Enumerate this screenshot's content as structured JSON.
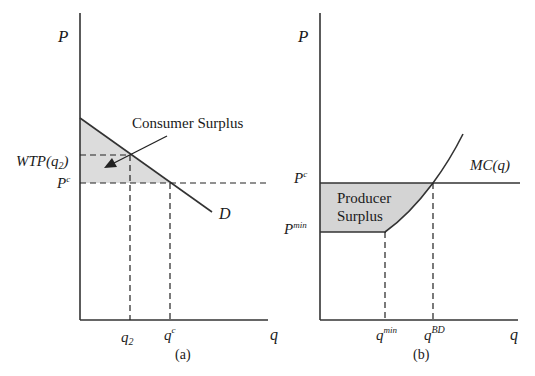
{
  "panel_a": {
    "y_axis_label": "P",
    "x_axis_label": "q",
    "caption": "(a)",
    "annotation": "Consumer Surplus",
    "curve_label": "D",
    "y_tick_wtp": "WTP(q",
    "y_tick_wtp_sub": "2",
    "y_tick_wtp_close": ")",
    "y_tick_pc": "P",
    "y_tick_pc_sup": "c",
    "x_tick_q2": "q",
    "x_tick_q2_sub": "2",
    "x_tick_qc": "q",
    "x_tick_qc_sup": "c",
    "shade_color": "#dcdcdc"
  },
  "panel_b": {
    "y_axis_label": "P",
    "x_axis_label": "q",
    "caption": "(b)",
    "region_label_line1": "Producer",
    "region_label_line2": "Surplus",
    "curve_label": "MC(q)",
    "y_tick_pc": "P",
    "y_tick_pc_sup": "c",
    "y_tick_pmin": "P",
    "y_tick_pmin_sup": "min",
    "x_tick_qmin": "q",
    "x_tick_qmin_sup": "min",
    "x_tick_qbd": "q",
    "x_tick_qbd_sup": "BD",
    "shade_color": "#d4d4d4"
  }
}
